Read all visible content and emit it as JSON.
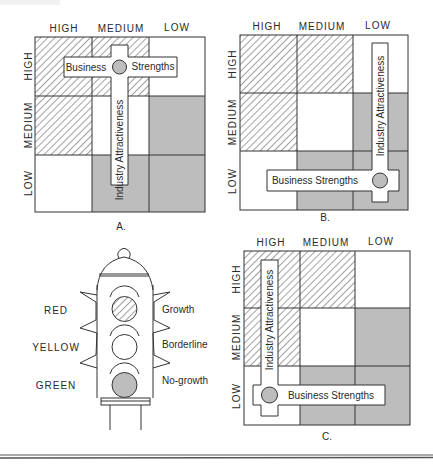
{
  "figure": {
    "panels": [
      {
        "id": "A",
        "caption": "A.",
        "column_labels": [
          "HIGH",
          "MEDIUM",
          "LOW"
        ],
        "row_labels": [
          "HIGH",
          "MEDIUM",
          "LOW"
        ],
        "horizontal_bar_label_left": "Business",
        "horizontal_bar_label_right": "Strengths",
        "vertical_bar_label": "Industry Attractiveness"
      },
      {
        "id": "B",
        "caption": "B.",
        "column_labels": [
          "HIGH",
          "MEDIUM",
          "LOW"
        ],
        "row_labels": [
          "HIGH",
          "MEDIUM",
          "LOW"
        ],
        "horizontal_bar_label": "Business Strengths",
        "vertical_bar_label": "Industry Attractiveness"
      },
      {
        "id": "C",
        "caption": "C.",
        "column_labels": [
          "HIGH",
          "MEDIUM",
          "LOW"
        ],
        "row_labels": [
          "HIGH",
          "MEDIUM",
          "LOW"
        ],
        "horizontal_bar_label": "Business Strengths",
        "vertical_bar_label": "Industry Attractiveness"
      }
    ],
    "traffic_light": {
      "lights": [
        {
          "color_name": "RED",
          "meaning": "Growth",
          "fill": "hatched"
        },
        {
          "color_name": "YELLOW",
          "meaning": "Borderline",
          "fill": "clear"
        },
        {
          "color_name": "GREEN",
          "meaning": "No-growth",
          "fill": "shaded"
        }
      ]
    },
    "legend_fills": {
      "hatched": "Growth (red)",
      "clear": "Borderline (yellow)",
      "shaded": "No-growth (green)"
    },
    "colors": {
      "shade": "#bdbdbd",
      "line": "#333333",
      "background": "#ffffff"
    }
  }
}
